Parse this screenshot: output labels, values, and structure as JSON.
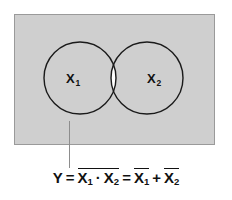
{
  "diagram": {
    "type": "venn-diagram",
    "panel": {
      "fill_color": "#cfcfcf",
      "border_color": "#9a9a9a",
      "description": "Shaded universe rectangle"
    },
    "circles": [
      {
        "id": "left",
        "label": "X",
        "subscript": "1",
        "stroke_color": "#1a1a1a",
        "fill": "transparent"
      },
      {
        "id": "right",
        "label": "X",
        "subscript": "2",
        "stroke_color": "#1a1a1a",
        "fill": "transparent"
      }
    ],
    "intersection": {
      "fill_color": "#ffffff",
      "description": "Unshaded lens region X1 AND X2"
    },
    "leader_line": {
      "color": "#8d8d8d",
      "description": "Pointer from shaded region to formula"
    }
  },
  "formula": {
    "output": "Y",
    "equals_1": "=",
    "equals_2": "=",
    "and_dot": "·",
    "or_plus": "+",
    "term_nand": {
      "left_var": "X",
      "left_sub": "1",
      "right_var": "X",
      "right_sub": "2"
    },
    "term_or": {
      "left_var": "X",
      "left_sub": "1",
      "right_var": "X",
      "right_sub": "2"
    },
    "plain_text": "Y = X1 · X2 = X1 + X2 (complemented)"
  }
}
